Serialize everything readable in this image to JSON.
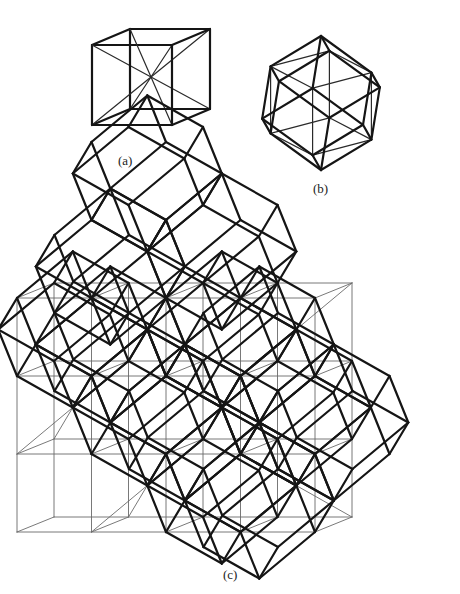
{
  "figure": {
    "labels": {
      "a": "(a)",
      "b": "(b)",
      "c": "(c)"
    },
    "colors": {
      "background": "#ffffff",
      "thin_line": "#6a6a6a",
      "thick_line": "#151515"
    },
    "panel_a": {
      "description": "Cube with its four body diagonals",
      "front_top_left": [
        92,
        45
      ],
      "edge": 80,
      "depth_offset": [
        38,
        -16
      ]
    },
    "panel_b": {
      "description": "Rhombic dodecahedron built on a cube",
      "center": [
        321,
        103
      ],
      "scale": 76
    },
    "panel_c": {
      "description": "Cubic lattice with space-filling rhombic dodecahedra",
      "origin_front_top_left": [
        17,
        298
      ],
      "cell_width": 74.5,
      "cell_height": 78,
      "depth_offset": [
        37,
        -15
      ],
      "lattice_size": [
        4,
        3,
        1
      ],
      "dodecahedra_cells": [
        [
          1,
          -2,
          0
        ],
        [
          2,
          -1,
          0
        ],
        [
          1,
          -1,
          -1
        ],
        [
          0,
          0,
          0
        ],
        [
          1,
          0,
          -1
        ],
        [
          2,
          0,
          0
        ],
        [
          3,
          0,
          -1
        ],
        [
          1,
          1,
          0
        ],
        [
          2,
          1,
          -1
        ],
        [
          3,
          1,
          0
        ],
        [
          4,
          1,
          -1
        ],
        [
          2,
          2,
          0
        ],
        [
          3,
          2,
          -1
        ]
      ]
    }
  }
}
